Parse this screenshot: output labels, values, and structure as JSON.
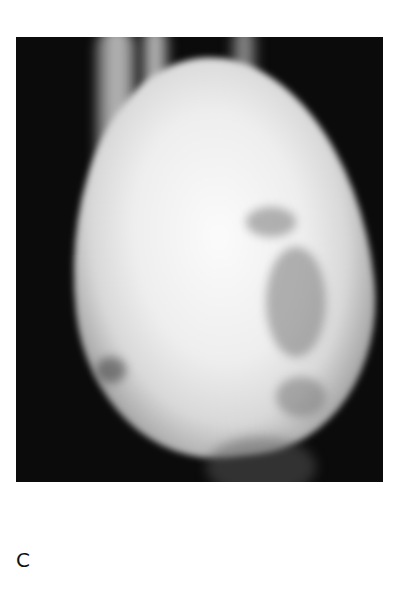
{
  "figure": {
    "image_description": "Radiograph showing a large lobulated radiodense mass",
    "panel_label": "C"
  }
}
